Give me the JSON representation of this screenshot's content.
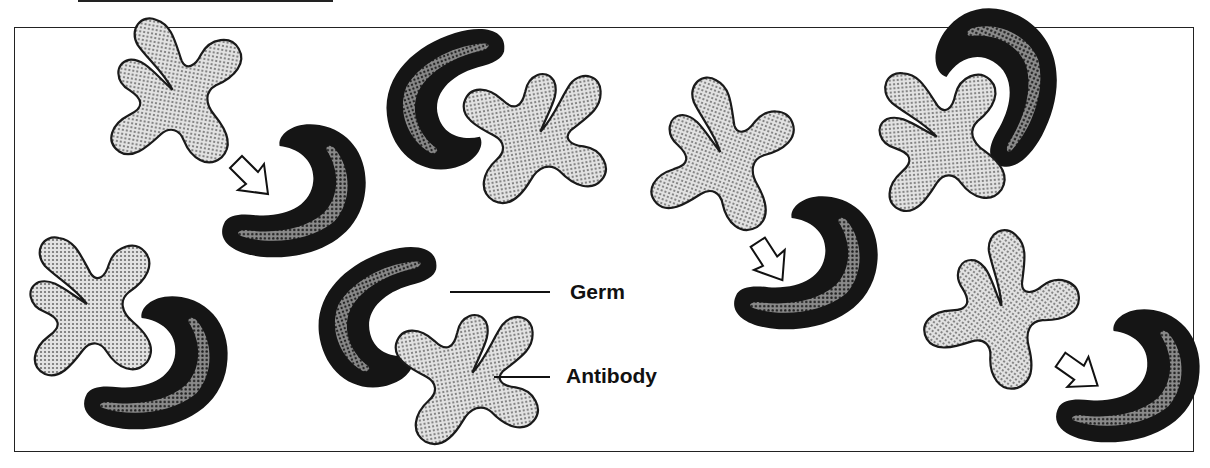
{
  "figure": {
    "title": "",
    "labels": {
      "germ": "Germ",
      "antibody": "Antibody"
    },
    "colors": {
      "antibody_fill": "#c8c8c8",
      "antibody_outline": "#1a1a1a",
      "germ_outer": "#151515",
      "germ_inner_band": "#6a6a6a",
      "frame": "#222222",
      "background": "#ffffff"
    },
    "pairs": [
      {
        "id": 1,
        "position": "top-left",
        "state": "approaching",
        "has_arrow": true
      },
      {
        "id": 2,
        "position": "bottom-left",
        "state": "bound",
        "has_arrow": false
      },
      {
        "id": 3,
        "position": "top-center",
        "state": "bound",
        "has_arrow": false
      },
      {
        "id": 4,
        "position": "bottom-center",
        "state": "bound",
        "has_arrow": false,
        "labeled": true
      },
      {
        "id": 5,
        "position": "center-right",
        "state": "approaching",
        "has_arrow": true
      },
      {
        "id": 6,
        "position": "top-right",
        "state": "bound",
        "has_arrow": false
      },
      {
        "id": 7,
        "position": "bottom-right",
        "state": "approaching",
        "has_arrow": true
      }
    ]
  }
}
